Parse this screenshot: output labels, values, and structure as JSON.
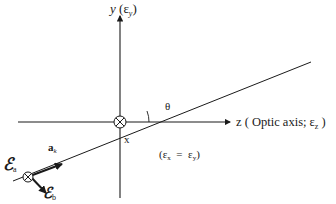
{
  "diagram": {
    "axes": {
      "y": {
        "label": "y",
        "paren_open": " (",
        "symbol": "ε",
        "subscript": "y",
        "paren_close": ")"
      },
      "z": {
        "label": "z ( Optic axis; ",
        "symbol": "ε",
        "subscript": "z",
        "paren_close": " )"
      },
      "x": {
        "label": "x"
      }
    },
    "angle": {
      "label": "θ"
    },
    "wave_vector": {
      "label": "a",
      "subscript": "k"
    },
    "field_a": {
      "symbol": "ℰ",
      "subscript": "a"
    },
    "field_b": {
      "symbol": "ℰ",
      "subscript": "b"
    },
    "condition": {
      "open": "(ε",
      "sub_x": "x",
      "middle": "  =  ε",
      "sub_y": "y",
      "close": ")"
    },
    "colors": {
      "line": "#1a1a1a",
      "background": "#ffffff"
    }
  }
}
